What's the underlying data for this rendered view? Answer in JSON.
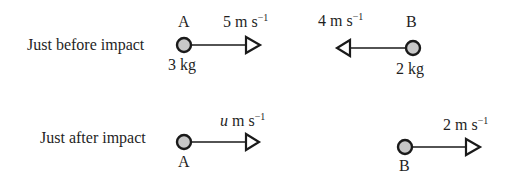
{
  "diagram": {
    "colors": {
      "particle_fill": "#c8c8c8",
      "particle_stroke": "#1a1a1a",
      "line": "#1a1a1a",
      "text": "#1f1f1f"
    },
    "before": {
      "row_label": "Just before impact",
      "particle_a": {
        "name": "A",
        "mass": "3 kg",
        "velocity": {
          "value": "5",
          "unit": "m s",
          "exp": "−1",
          "direction": "right"
        }
      },
      "particle_b": {
        "name": "B",
        "mass": "2 kg",
        "velocity": {
          "value": "4",
          "unit": "m s",
          "exp": "−1",
          "direction": "left"
        }
      }
    },
    "after": {
      "row_label": "Just after impact",
      "particle_a": {
        "name": "A",
        "velocity": {
          "value": "u",
          "unit": "m s",
          "exp": "−1",
          "direction": "right"
        }
      },
      "particle_b": {
        "name": "B",
        "velocity": {
          "value": "2",
          "unit": "m s",
          "exp": "−1",
          "direction": "right"
        }
      }
    }
  }
}
